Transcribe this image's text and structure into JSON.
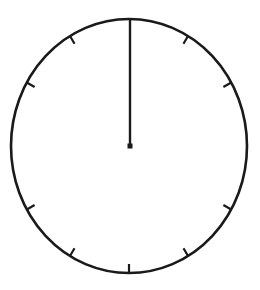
{
  "widget": {
    "name": "analog-clock-dial",
    "title": "Clock Dial",
    "background_color": "#ffffff",
    "stroke_color": "#1a1a1a"
  },
  "dial": {
    "center_x": 129,
    "center_y": 146,
    "radius_x": 118,
    "radius_y": 127,
    "rim_stroke_width": 2.6,
    "rim_color": "#1a1a1a"
  },
  "ticks": {
    "color": "#1a1a1a",
    "stroke_width": 2.2,
    "length": 9,
    "marks": [
      {
        "label": "11",
        "angle_deg": -30,
        "present": true
      },
      {
        "label": "12",
        "angle_deg": 0,
        "present": false
      },
      {
        "label": "1",
        "angle_deg": 30,
        "present": true
      },
      {
        "label": "2",
        "angle_deg": 60,
        "present": true
      },
      {
        "label": "3",
        "angle_deg": 90,
        "present": false
      },
      {
        "label": "4",
        "angle_deg": 120,
        "present": true
      },
      {
        "label": "5",
        "angle_deg": 150,
        "present": true
      },
      {
        "label": "6",
        "angle_deg": 180,
        "present": true
      },
      {
        "label": "7",
        "angle_deg": 210,
        "present": true
      },
      {
        "label": "8",
        "angle_deg": 240,
        "present": true
      },
      {
        "label": "9",
        "angle_deg": 270,
        "present": false
      },
      {
        "label": "10",
        "angle_deg": 300,
        "present": true
      }
    ]
  },
  "hand": {
    "name": "clock-hand",
    "angle_deg": 0,
    "points_to": "12",
    "color": "#1a1a1a",
    "stroke_width": 2.4,
    "tip_x": 130,
    "tip_y": 19,
    "base_x": 130,
    "base_y": 146
  },
  "hub": {
    "name": "center-hub",
    "x": 130,
    "y": 146,
    "size": 5,
    "color": "#1a1a1a"
  }
}
